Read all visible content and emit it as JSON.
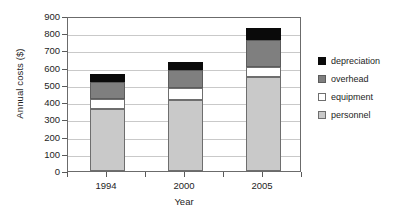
{
  "chart_data": {
    "type": "bar",
    "stacked": true,
    "title": "",
    "xlabel": "Year",
    "ylabel": "Annual costs ($)",
    "categories": [
      "1994",
      "2000",
      "2005"
    ],
    "series": [
      {
        "name": "personnel",
        "values": [
          360,
          415,
          545
        ],
        "color": "#c9c9c9"
      },
      {
        "name": "equipment",
        "values": [
          58,
          65,
          60
        ],
        "color": "#ffffff"
      },
      {
        "name": "overhead",
        "values": [
          99,
          105,
          155
        ],
        "color": "#7f7f7f"
      },
      {
        "name": "depreciation",
        "values": [
          48,
          50,
          70
        ],
        "color": "#0a0a0a"
      }
    ],
    "totals": [
      565,
      635,
      830
    ],
    "ylim": [
      0,
      900
    ],
    "ytick_step": 100,
    "yticks": [
      "900",
      "800",
      "700",
      "600",
      "500",
      "400",
      "300",
      "200",
      "100",
      "0"
    ],
    "grid": true,
    "legend_position": "right",
    "legend_order": [
      "depreciation",
      "overhead",
      "equipment",
      "personnel"
    ]
  },
  "axes": {
    "y_title": "Annual costs ($)",
    "x_title": "Year"
  },
  "legend": {
    "items": [
      {
        "label": "depreciation"
      },
      {
        "label": "overhead"
      },
      {
        "label": "equipment"
      },
      {
        "label": "personnel"
      }
    ]
  }
}
